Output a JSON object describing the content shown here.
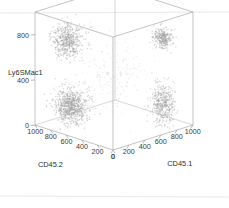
{
  "figure": {
    "background_color": "#ffffff",
    "point_color": "#9d9d9d",
    "frame_color": "#a9a9a9",
    "text_color": "#2e2e2e"
  },
  "chart_data": {
    "type": "scatter",
    "projection": "3d",
    "title": "",
    "xlabel": "CD45.2",
    "ylabel": "CD45.1",
    "zlabel": "Ly6SMac1",
    "xlim": [
      0,
      1000
    ],
    "ylim": [
      0,
      1000
    ],
    "zlim": [
      0,
      1000
    ],
    "grid": false,
    "legend": null,
    "axes": {
      "x": {
        "label": "CD45.2",
        "ticks": [
          0,
          200,
          400,
          600,
          800,
          1000
        ],
        "tick_labels": [
          "0",
          "200",
          "400",
          "600",
          "800",
          "1000"
        ],
        "direction": "descending-left-to-front"
      },
      "y": {
        "label": "CD45.1",
        "ticks": [
          0,
          200,
          400,
          600,
          800,
          1000
        ],
        "tick_labels": [
          "0",
          "200",
          "400",
          "600",
          "800",
          "1000"
        ],
        "direction": "ascending-front-to-right"
      },
      "z": {
        "label": "Ly6SMac1",
        "ticks": [
          0,
          400,
          800
        ],
        "tick_labels": [
          "0",
          "400",
          "800"
        ],
        "direction": "ascending-upward"
      }
    },
    "clusters": [
      {
        "name": "upper-left-cluster",
        "center": [
          760,
          180,
          760
        ],
        "spread": [
          150,
          120,
          130
        ],
        "n_points": 520,
        "density": "diffuse-large"
      },
      {
        "name": "upper-right-cluster",
        "center": [
          170,
          790,
          780
        ],
        "spread": [
          85,
          80,
          80
        ],
        "n_points": 300,
        "density": "compact-round"
      },
      {
        "name": "lower-left-cluster",
        "center": [
          740,
          200,
          180
        ],
        "spread": [
          150,
          130,
          140
        ],
        "n_points": 760,
        "density": "very-dense"
      },
      {
        "name": "lower-right-cluster",
        "center": [
          150,
          770,
          200
        ],
        "spread": [
          95,
          95,
          170
        ],
        "n_points": 430,
        "density": "medium-elongated"
      },
      {
        "name": "scatter-noise",
        "center": [
          500,
          500,
          450
        ],
        "spread": [
          330,
          330,
          330
        ],
        "n_points": 170,
        "density": "sparse-background"
      }
    ]
  }
}
